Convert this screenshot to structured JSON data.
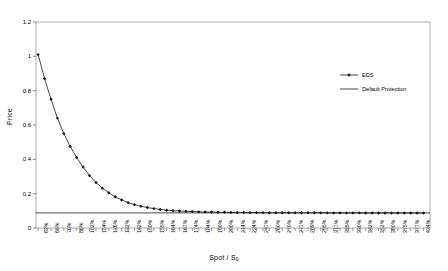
{
  "chart_data": {
    "type": "line",
    "title": "",
    "xlabel": "Spot / S",
    "xlabel_sub": "0",
    "ylabel": "Price",
    "ylim": [
      0,
      1.2
    ],
    "yticks": [
      "0",
      "0.2",
      "0.4",
      "0.6",
      "0.8",
      "1",
      "1.2"
    ],
    "ytick_values": [
      0,
      0.2,
      0.4,
      0.6,
      0.8,
      1,
      1.2
    ],
    "grid": false,
    "legend_position": "upper right",
    "categories": [
      "62%",
      "65%",
      "70%",
      "86%",
      "102%",
      "114%",
      "126%",
      "132%",
      "142%",
      "150%",
      "155%",
      "164%",
      "167%",
      "174%",
      "184%",
      "190%",
      "200%",
      "214%",
      "224%",
      "247%",
      "260%",
      "270%",
      "277%",
      "289%",
      "295%",
      "317%",
      "325%",
      "330%",
      "342%",
      "352%",
      "360%",
      "375%",
      "377%",
      "424%"
    ],
    "x": [
      62,
      65,
      70,
      86,
      102,
      114,
      126,
      132,
      142,
      150,
      155,
      164,
      167,
      174,
      184,
      190,
      200,
      214,
      224,
      247,
      260,
      270,
      277,
      289,
      295,
      317,
      325,
      330,
      342,
      352,
      360,
      375,
      377,
      424
    ],
    "x_labels_rotated": true,
    "series": [
      {
        "name": "EDS",
        "marker": "diamond",
        "color": "#000000",
        "x": [
          62,
          68,
          74,
          80,
          86,
          92,
          98,
          104,
          110,
          116,
          122,
          128,
          134,
          140,
          146,
          152,
          158,
          164,
          170,
          176,
          182,
          188,
          194,
          200,
          206,
          212,
          218,
          224,
          230,
          236,
          242,
          248,
          254,
          260,
          266,
          272,
          278,
          284,
          290,
          296,
          302,
          308,
          314,
          320,
          326,
          332,
          338,
          344,
          350,
          356,
          362,
          368,
          374,
          380,
          386,
          392,
          398,
          404,
          410,
          416,
          422
        ],
        "values": [
          1.01,
          0.87,
          0.75,
          0.64,
          0.55,
          0.475,
          0.41,
          0.355,
          0.305,
          0.265,
          0.232,
          0.205,
          0.182,
          0.163,
          0.148,
          0.136,
          0.127,
          0.119,
          0.113,
          0.108,
          0.104,
          0.101,
          0.099,
          0.097,
          0.0955,
          0.094,
          0.093,
          0.0925,
          0.092,
          0.0915,
          0.091,
          0.0905,
          0.09,
          0.0898,
          0.0896,
          0.0894,
          0.0892,
          0.089,
          0.0889,
          0.0888,
          0.0887,
          0.0886,
          0.0885,
          0.0884,
          0.0883,
          0.0882,
          0.0881,
          0.088,
          0.088,
          0.0879,
          0.0879,
          0.0878,
          0.0878,
          0.0877,
          0.0877,
          0.0877,
          0.0876,
          0.0876,
          0.0876,
          0.0875,
          0.0875
        ]
      },
      {
        "name": "Default Protection",
        "marker": "none",
        "color": "#000000",
        "constant_value": 0.088
      }
    ]
  },
  "legend": {
    "items": [
      {
        "label": "EDS",
        "style": "line-marker"
      },
      {
        "label": "Default Protection",
        "style": "line"
      }
    ]
  },
  "colors": {
    "axis": "#6b6b6b",
    "frame": "#9a9a9a",
    "series": "#1a1a1a"
  }
}
